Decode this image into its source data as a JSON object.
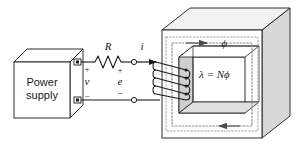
{
  "figure": {
    "background_color": "#ffffff",
    "line_color": "#1a1a1a",
    "shade_color": "#d5d5d5",
    "flux_path_color": "#8a8a8a"
  },
  "source": {
    "box_label_line1": "Power",
    "box_label_line2": "supply",
    "terminal_positive_sign": "+",
    "terminal_negative_sign": "−",
    "voltage_label": "v"
  },
  "circuit": {
    "resistor_label": "R",
    "current_label": "i",
    "emf_label": "e",
    "emf_positive_sign": "+",
    "emf_negative_sign": "−",
    "coil_turns": 5
  },
  "core": {
    "flux_label": "ϕ",
    "flux_linkage_label": "λ = Nϕ",
    "top_arrow_direction": "right",
    "bottom_arrow_direction": "left"
  }
}
